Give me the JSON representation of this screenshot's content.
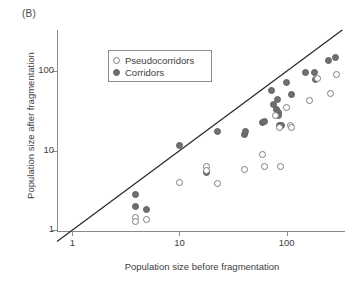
{
  "panel": {
    "label": "(B)"
  },
  "legend": {
    "position": "upper-left-inside",
    "entries": [
      {
        "label": "Pseudocorridors",
        "marker": "open-circle",
        "color": "#7d7d7d"
      },
      {
        "label": "Corridors",
        "marker": "filled-circle",
        "color": "#6f6f6f"
      }
    ]
  },
  "chart_data": {
    "type": "scatter",
    "title": "",
    "xlabel": "Population size before fragmentation",
    "ylabel": "Population size after fragmentation",
    "xscale": "log",
    "yscale": "log",
    "xlim": [
      0.72,
      350
    ],
    "ylim": [
      0.95,
      330
    ],
    "xticks": [
      1,
      10,
      100
    ],
    "xticklabels": [
      "1",
      "10",
      "100"
    ],
    "yticks": [
      1,
      10,
      100
    ],
    "yticklabels": [
      "1",
      "10",
      "100"
    ],
    "grid": false,
    "annotations": [
      {
        "type": "line",
        "name": "one-to-one-line",
        "label": "1:1 reference line",
        "from": [
          0.72,
          0.72
        ],
        "to": [
          330,
          330
        ],
        "color": "#2b2b2b"
      }
    ],
    "series": [
      {
        "name": "Corridors",
        "marker": "filled-circle",
        "color": "#6f6f6f",
        "points": [
          [
            3.9,
            2.8
          ],
          [
            3.9,
            2.0
          ],
          [
            4.9,
            1.8
          ],
          [
            10.0,
            11.5
          ],
          [
            18.0,
            5.4
          ],
          [
            22.5,
            17.5
          ],
          [
            40.0,
            16.0
          ],
          [
            41.0,
            17.5
          ],
          [
            60.0,
            22.5
          ],
          [
            62.0,
            23.0
          ],
          [
            72.0,
            57.0
          ],
          [
            75.0,
            38.0
          ],
          [
            80.0,
            33.0
          ],
          [
            82.0,
            44.0
          ],
          [
            83.0,
            30.0
          ],
          [
            84.0,
            27.5
          ],
          [
            86.0,
            21.0
          ],
          [
            90.0,
            20.5
          ],
          [
            100.0,
            72.0
          ],
          [
            112.0,
            51.0
          ],
          [
            150.0,
            96.0
          ],
          [
            180.0,
            95.0
          ],
          [
            185.0,
            78.0
          ],
          [
            245.0,
            135.0
          ],
          [
            285.0,
            150.0
          ]
        ]
      },
      {
        "name": "Pseudocorridors",
        "marker": "open-circle",
        "color": "#7d7d7d",
        "points": [
          [
            3.9,
            1.45
          ],
          [
            3.9,
            1.3
          ],
          [
            4.9,
            1.35
          ],
          [
            10.0,
            4.0
          ],
          [
            18.0,
            6.3
          ],
          [
            18.0,
            5.6
          ],
          [
            22.5,
            3.9
          ],
          [
            40.0,
            5.8
          ],
          [
            60.0,
            9.0
          ],
          [
            62.0,
            6.4
          ],
          [
            78.0,
            28.0
          ],
          [
            85.0,
            19.5
          ],
          [
            88.0,
            6.4
          ],
          [
            100.0,
            35.0
          ],
          [
            108.0,
            21.0
          ],
          [
            112.0,
            19.5
          ],
          [
            165.0,
            43.0
          ],
          [
            195.0,
            80.0
          ],
          [
            255.0,
            53.0
          ],
          [
            290.0,
            90.0
          ]
        ]
      }
    ]
  }
}
